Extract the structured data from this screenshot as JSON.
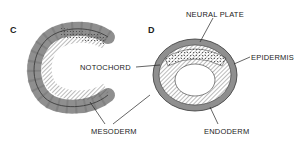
{
  "panels": [
    {
      "letter": "C",
      "labels": {
        "notochord": "NOTOCHORD",
        "mesoderm": "MESODERM"
      }
    },
    {
      "letter": "D",
      "labels": {
        "neural_plate": "NEURAL PLATE",
        "epidermis": "EPIDERMIS",
        "endoderm": "ENDODERM"
      }
    }
  ],
  "colors": {
    "outer_cells": "#8f8f8f",
    "inner_cells": "#ffffff",
    "outline": "#333333",
    "background": "#ffffff"
  }
}
